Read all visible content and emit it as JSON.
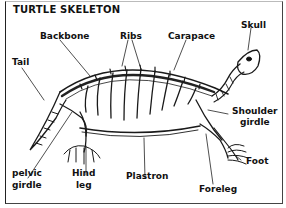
{
  "diagram": {
    "title": "TURTLE SKELETON",
    "labels": {
      "backbone": "Backbone",
      "ribs": "Ribs",
      "carapace": "Carapace",
      "skull": "Skull",
      "tail": "Tail",
      "shoulder_girdle_line1": "Shoulder",
      "shoulder_girdle_line2": "girdle",
      "foot": "Foot",
      "pelvic_girdle_line1": "pelvic",
      "pelvic_girdle_line2": "girdle",
      "hind_leg_line1": "Hind",
      "hind_leg_line2": "leg",
      "plastron": "Plastron",
      "foreleg": "Foreleg"
    }
  }
}
